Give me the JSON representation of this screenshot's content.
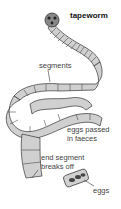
{
  "diagram": {
    "title": "tapeworm",
    "labels": {
      "segments": "segments",
      "eggs_passed_line1": "eggs passed",
      "eggs_passed_line2": "in faeces",
      "end_segment_line1": "end segment",
      "end_segment_line2": "breaks off",
      "eggs": "eggs"
    },
    "colors": {
      "body_fill": "#d0d0d0",
      "outline": "#333333",
      "head": "#555555"
    }
  }
}
